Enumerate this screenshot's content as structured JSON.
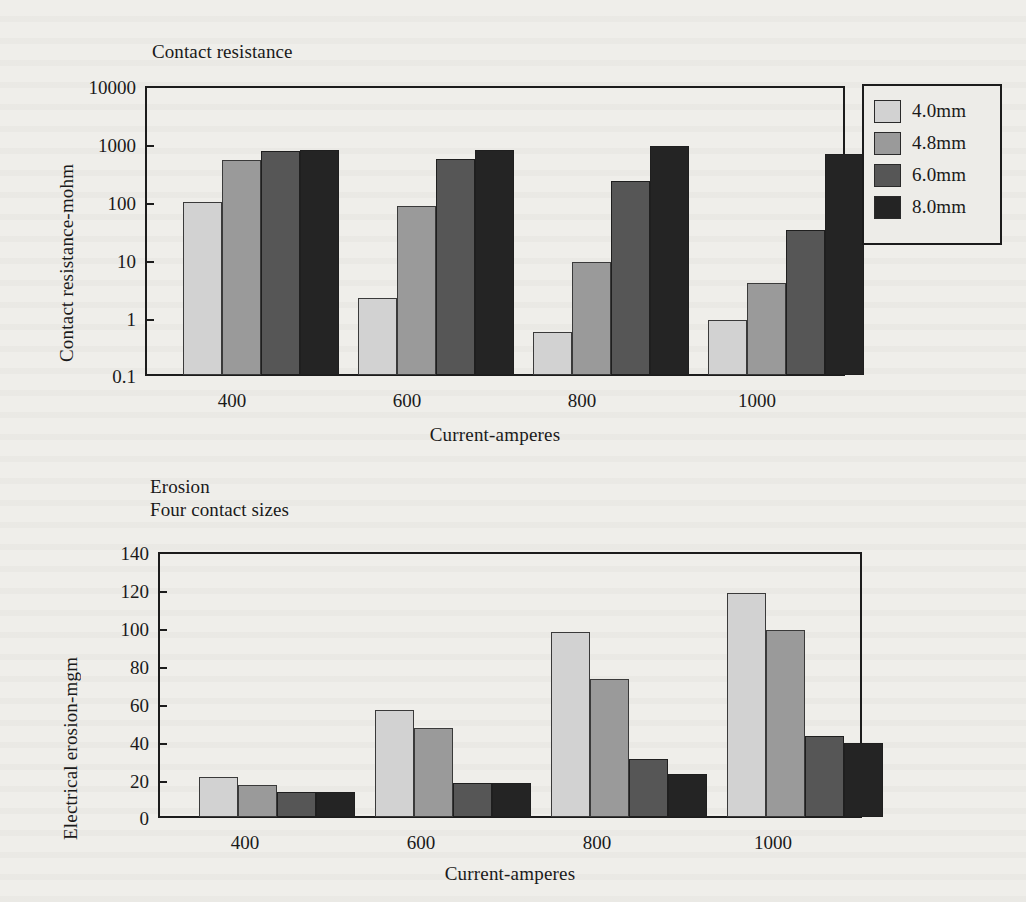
{
  "page": {
    "background_color": "#efeeea",
    "ink_color": "#1a1a1a"
  },
  "series_colors": {
    "4.0mm": "#d2d2d2",
    "4.8mm": "#9a9a9a",
    "6.0mm": "#565656",
    "8.0mm": "#242424"
  },
  "legend": {
    "name": "contact-size-legend",
    "entries": [
      {
        "label": "4.0mm",
        "color": "#d2d2d2"
      },
      {
        "label": "4.8mm",
        "color": "#9a9a9a"
      },
      {
        "label": "6.0mm",
        "color": "#565656"
      },
      {
        "label": "8.0mm",
        "color": "#242424"
      }
    ]
  },
  "chart_data": [
    {
      "id": "contact-resistance-chart",
      "type": "bar",
      "title": "Contact resistance",
      "xlabel": "Current-amperes",
      "ylabel": "Contact resistance-mohm",
      "yscale": "log",
      "ylim": [
        0.1,
        10000
      ],
      "yticks": [
        0.1,
        1,
        10,
        100,
        1000,
        10000
      ],
      "ytick_labels": [
        "0.1",
        "1",
        "10",
        "100",
        "1000",
        "10000"
      ],
      "grid": false,
      "legend_position": "right-outside",
      "categories": [
        "400",
        "600",
        "800",
        "1000"
      ],
      "series": [
        {
          "name": "4.0mm",
          "values": [
            100,
            2.2,
            0.55,
            0.9
          ]
        },
        {
          "name": "4.8mm",
          "values": [
            550,
            86,
            9,
            4
          ]
        },
        {
          "name": "6.0mm",
          "values": [
            780,
            560,
            230,
            33
          ]
        },
        {
          "name": "8.0mm",
          "values": [
            790,
            800,
            950,
            680
          ]
        }
      ]
    },
    {
      "id": "erosion-chart",
      "type": "bar",
      "title": "Erosion\nFour contact sizes",
      "xlabel": "Current-amperes",
      "ylabel": "Electrical erosion-mgm",
      "yscale": "linear",
      "ylim": [
        0,
        140
      ],
      "yticks": [
        0,
        20,
        40,
        60,
        80,
        100,
        120,
        140
      ],
      "ytick_labels": [
        "0",
        "20",
        "40",
        "60",
        "80",
        "100",
        "120",
        "140"
      ],
      "grid": false,
      "legend_position": "none",
      "categories": [
        "400",
        "600",
        "800",
        "1000"
      ],
      "series": [
        {
          "name": "4.0mm",
          "values": [
            21,
            57,
            98,
            119
          ]
        },
        {
          "name": "4.8mm",
          "values": [
            17,
            47,
            73,
            99
          ]
        },
        {
          "name": "6.0mm",
          "values": [
            13,
            18,
            31,
            43
          ]
        },
        {
          "name": "8.0mm",
          "values": [
            13,
            18,
            23,
            39
          ]
        }
      ]
    }
  ]
}
